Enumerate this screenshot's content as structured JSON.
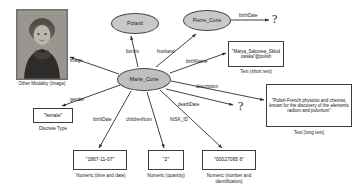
{
  "diagram": {
    "center_node": {
      "label": "Marie_Curie"
    },
    "entity_nodes": [
      {
        "id": "poland",
        "label": "Poland"
      },
      {
        "id": "pierre",
        "label": "Pierre_Curie"
      }
    ],
    "edges": [
      {
        "id": "image",
        "label": "image"
      },
      {
        "id": "bornIn",
        "label": "bornIn"
      },
      {
        "id": "husband",
        "label": "husband"
      },
      {
        "id": "birthName",
        "label": "birthName"
      },
      {
        "id": "description",
        "label": "description"
      },
      {
        "id": "deathDate",
        "label": "deathDate"
      },
      {
        "id": "gender",
        "label": "gender"
      },
      {
        "id": "birthDate",
        "label": "birthDate"
      },
      {
        "id": "childrenNum",
        "label": "childrenNum"
      },
      {
        "id": "NISK_ID",
        "label": "NISK_ID"
      },
      {
        "id": "pierreBirthDate",
        "label": "birthDate"
      }
    ],
    "literals": {
      "gender": {
        "value": "\"female\"",
        "caption": "Discrete Type"
      },
      "birth_date": {
        "value": "\"1867-11-07\"",
        "caption": "Numeric (time and date)"
      },
      "children_num": {
        "value": "\"2\"",
        "caption": "Numeric (quantity)"
      },
      "nisk_id": {
        "value": "\"00027095 6\"",
        "caption": "Numeric (number and identification)"
      },
      "birth_name": {
        "value": "\"Marya_Salomea_Skłodowska\"@polish",
        "caption": "Text (short text)"
      },
      "description": {
        "value": "\"Polish-French physicist and chemist, known for the discovery of the elements radium and polonium\"",
        "caption": "Text (long text)"
      },
      "image": {
        "caption": "Other Modality (Image)"
      }
    },
    "unknowns": [
      {
        "id": "pierre-birthdate-unknown",
        "glyph": "?"
      },
      {
        "id": "deathdate-unknown",
        "glyph": "?"
      }
    ],
    "colors": {
      "node_fill": "#c9c9c9",
      "node_stroke": "#4a4a4a",
      "box_stroke": "#3d3d3d",
      "edge_stroke": "#2b2b2b",
      "text": "#1a1a1a",
      "background": "#ffffff"
    }
  }
}
